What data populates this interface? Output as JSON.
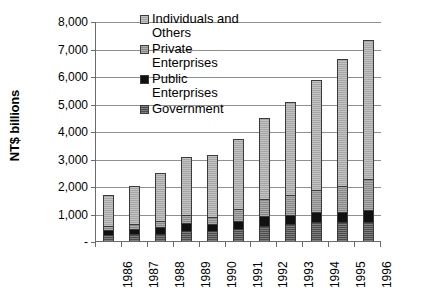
{
  "chart_data": {
    "type": "bar",
    "subtype": "stacked-column",
    "title": "",
    "xlabel": "",
    "ylabel": "NT$ billions",
    "ylim": [
      0,
      8000
    ],
    "ytick_labels": [
      "-",
      "1,000",
      "2,000",
      "3,000",
      "4,000",
      "5,000",
      "6,000",
      "7,000",
      "8,000"
    ],
    "ytick_values": [
      0,
      1000,
      2000,
      3000,
      4000,
      5000,
      6000,
      7000,
      8000
    ],
    "grid": true,
    "legend_position": "top-center-inside",
    "categories": [
      "1986",
      "1987",
      "1988",
      "1989",
      "1990",
      "1991",
      "1992",
      "1993",
      "1994",
      "1995",
      "1996"
    ],
    "series": [
      {
        "name": "Government",
        "color": "#4c4c4c",
        "stack_order": 1,
        "values": [
          250,
          280,
          300,
          400,
          400,
          480,
          600,
          650,
          720,
          720,
          730
        ]
      },
      {
        "name": "Public Enterprises",
        "color": "#111111",
        "stack_order": 2,
        "values": [
          200,
          200,
          230,
          300,
          250,
          280,
          330,
          350,
          380,
          380,
          420
        ]
      },
      {
        "name": "Private Enterprises",
        "color": "#8a8a8a",
        "stack_order": 3,
        "values": [
          150,
          170,
          220,
          300,
          250,
          450,
          620,
          700,
          800,
          950,
          1150
        ]
      },
      {
        "name": "Individuals and Others",
        "color": "#a6a6a6",
        "stack_order": 4,
        "values": [
          1100,
          1400,
          1750,
          2100,
          2250,
          2540,
          2950,
          3400,
          4000,
          4600,
          5050
        ]
      }
    ],
    "totals": [
      1700,
      2050,
      2500,
      3100,
      3150,
      3750,
      4500,
      5100,
      5900,
      6650,
      7350
    ]
  },
  "axis": {
    "y_title": "NT$ billions"
  },
  "legend": {
    "entries": [
      {
        "label": "Individuals and\nOthers",
        "swatch": "swatch-individuals"
      },
      {
        "label": "Private\nEnterprises",
        "swatch": "swatch-private"
      },
      {
        "label": "Public\nEnterprises",
        "swatch": "swatch-public"
      },
      {
        "label": "Government",
        "swatch": "swatch-government"
      }
    ]
  }
}
